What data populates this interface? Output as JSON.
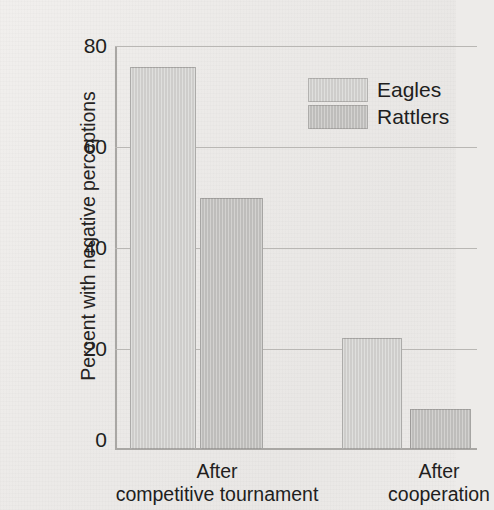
{
  "chart_data": {
    "type": "bar",
    "title": "",
    "subtitle": "",
    "xlabel": "",
    "ylabel": "Percent with negative perceptions",
    "categories": [
      "After competitive tournament",
      "After cooperation"
    ],
    "category_lines": [
      [
        "After",
        "competitive tournament"
      ],
      [
        "After",
        "cooperation"
      ]
    ],
    "series": [
      {
        "name": "Eagles",
        "values": [
          76,
          22
        ],
        "color": "#d3d2d0"
      },
      {
        "name": "Rattlers",
        "values": [
          50,
          8
        ],
        "color": "#c6c5c3"
      }
    ],
    "ylim": [
      0,
      80
    ],
    "yticks": [
      0,
      20,
      40,
      60,
      80
    ],
    "ytick_labels": [
      "0",
      "20",
      "40",
      "60",
      "80"
    ],
    "grid": true,
    "legend_position": "upper right",
    "annotations": []
  },
  "axis": {
    "y_title": "Percent with negative perceptions",
    "ticks": [
      {
        "label": "80",
        "value": 80
      },
      {
        "label": "60",
        "value": 60
      },
      {
        "label": "40",
        "value": 40
      },
      {
        "label": "20",
        "value": 20
      },
      {
        "label": "0",
        "value": 0
      }
    ]
  },
  "legend": {
    "entries": [
      {
        "label": "Eagles",
        "color": "#d3d2d0"
      },
      {
        "label": "Rattlers",
        "color": "#c6c5c3"
      }
    ]
  },
  "colors": {
    "background": "#edebe9",
    "eagles": "#d3d2d0",
    "rattlers": "#c6c5c3",
    "gridline": "#b9b7b4",
    "text": "#211e1d"
  }
}
